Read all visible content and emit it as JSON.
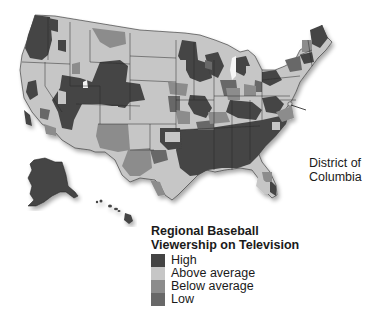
{
  "map": {
    "title_line1": "Regional Baseball",
    "title_line2": "Viewership on Television",
    "callout": {
      "line1": "District of",
      "line2": "Columbia"
    },
    "legend": [
      {
        "label": "High",
        "color": "#444444"
      },
      {
        "label": "Above average",
        "color": "#c6c6c6"
      },
      {
        "label": "Below average",
        "color": "#8c8c8c"
      },
      {
        "label": "Low",
        "color": "#686868"
      }
    ],
    "colors": {
      "high": "#444444",
      "above_average": "#c6c6c6",
      "below_average": "#8c8c8c",
      "low": "#686868",
      "border": "#2a2a2a",
      "background": "#ffffff"
    },
    "regions_visible": [
      "Contiguous United States",
      "Alaska",
      "Hawaii",
      "District of Columbia"
    ]
  }
}
